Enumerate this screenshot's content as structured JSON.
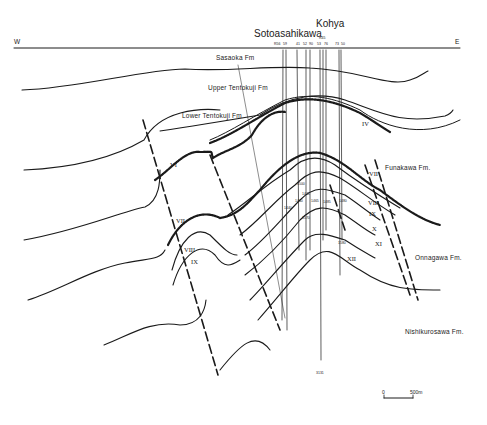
{
  "figure": {
    "type": "geological cross-section",
    "direction": {
      "west": "W",
      "east": "E"
    },
    "localities": {
      "sotoasahikawa": "Sotoasahikawa",
      "kohya": "Kohya"
    },
    "well_labels": [
      "R56",
      "59",
      "41",
      "52",
      "90",
      "53",
      "R45",
      "76",
      "73",
      "50"
    ],
    "formations": {
      "sasaoka": "Sasaoka Fm",
      "upper_tentokuji": "Upper Tentokuji Fm",
      "lower_tentokuji": "Lower Tentokuji Fm",
      "funakawa": "Funakawa Fm.",
      "onnagawa": "Onnagawa Fm.",
      "nishikurosawa": "Nishikurosawa Fm."
    },
    "horizons": {
      "iv": "IV",
      "vi": "VI",
      "vii_left": "VII",
      "vii_right": "VII",
      "viii_left": "VIII",
      "viii_right": "VIII",
      "ix_left": "IX",
      "ix_right": "IX",
      "x": "X",
      "xi": "XI",
      "xii": "XII"
    },
    "depth_marks": [
      "1500",
      "1445",
      "1440",
      "1465",
      "1485",
      "1440",
      "1480",
      "1570",
      "1580",
      "3131"
    ],
    "scale_bar": {
      "start": "0",
      "end": "500m"
    },
    "colors": {
      "ink": "#1a1a1a",
      "background": "#ffffff"
    }
  }
}
